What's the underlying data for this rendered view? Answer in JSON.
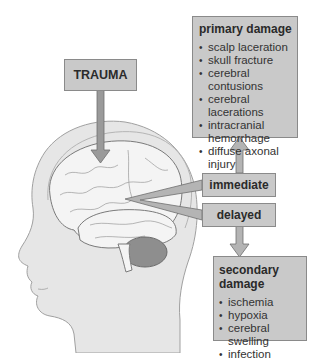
{
  "diagram": {
    "trauma_label": "TRAUMA",
    "immediate_label": "immediate",
    "delayed_label": "delayed",
    "primary": {
      "title": "primary damage",
      "items": [
        "scalp laceration",
        "skull fracture",
        "cerebral contusions",
        "cerebral lacerations",
        "intracranial hemorrhage",
        "diffuse axonal injury"
      ]
    },
    "secondary": {
      "title": "secondary damage",
      "items": [
        "ischemia",
        "hypoxia",
        "cerebral swelling",
        "infection"
      ]
    },
    "colors": {
      "box_fill": "#c9c9c9",
      "box_border": "#8a8a8a",
      "arrow_fill": "#9a9a9a",
      "head_fill": "#e6e6e6",
      "brain_fill": "#f4f4f4",
      "cerebellum_fill": "#8e8e8e"
    }
  }
}
